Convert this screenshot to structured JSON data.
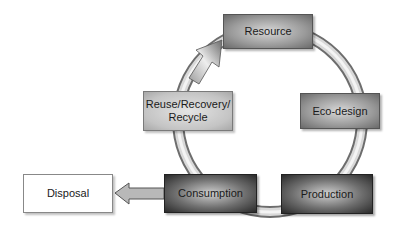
{
  "diagram": {
    "type": "cycle",
    "nodes": {
      "resource": "Resource",
      "eco_design": "Eco-design",
      "production": "Production",
      "consumption": "Consumption",
      "reuse": "Reuse/Recovery/ Recycle",
      "disposal": "Disposal"
    },
    "reuse_lines": [
      "Reuse/Recovery/",
      "Recycle"
    ],
    "edges": [
      {
        "from": "Resource",
        "to": "Eco-design"
      },
      {
        "from": "Eco-design",
        "to": "Production"
      },
      {
        "from": "Production",
        "to": "Consumption"
      },
      {
        "from": "Consumption",
        "to": "Reuse/Recovery/Recycle"
      },
      {
        "from": "Reuse/Recovery/Recycle",
        "to": "Resource",
        "arrow": true
      },
      {
        "from": "Consumption",
        "to": "Disposal",
        "arrow": true
      }
    ]
  }
}
